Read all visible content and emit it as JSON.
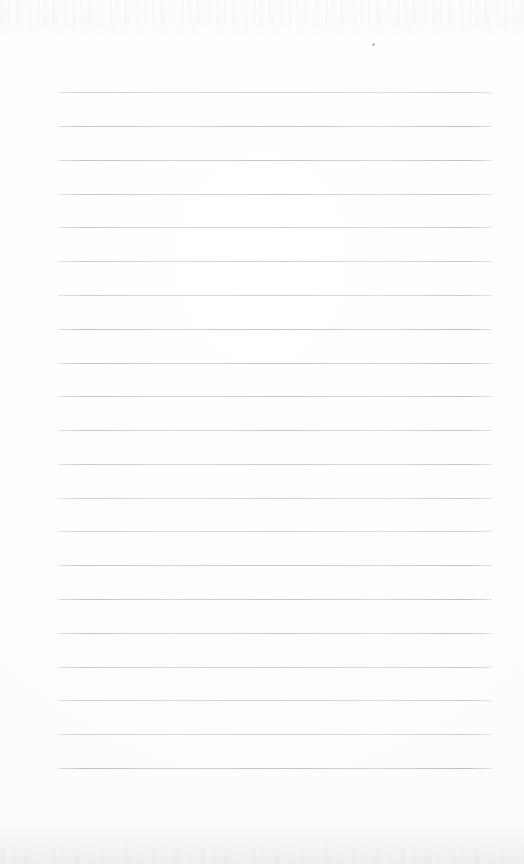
{
  "document": {
    "type": "scanned-lined-notebook-page",
    "title": "Blank Lined Notebook Page",
    "page_width": 524,
    "page_height": 864,
    "paper_color": "#fdfdfd",
    "background_color": "#ffffff",
    "has_visible_text": false,
    "written_content": "",
    "header_text": "",
    "footer_text": "",
    "page_number": ""
  },
  "ruling": {
    "line_color": "#bcbcc6",
    "line_thickness_px": 1,
    "line_count": 21,
    "line_left_px": 58,
    "line_right_px": 492,
    "line_width_px": 434,
    "line_spacing_px": 33.8,
    "first_line_y_px": 92,
    "last_line_y_px": 768,
    "line_y_positions": [
      92,
      126,
      160,
      194,
      227,
      261,
      295,
      329,
      363,
      396,
      430,
      464,
      498,
      531,
      565,
      599,
      633,
      667,
      700,
      734,
      768
    ],
    "has_vertical_margin_rule": false
  },
  "artifacts": {
    "speck": {
      "label": "dust-speck",
      "x_px": 372,
      "y_px": 43,
      "size_px": 3,
      "color": "#96969e"
    },
    "top_noise": {
      "label": "scanner-noise-top-edge",
      "y_px": 0,
      "height_px": 26,
      "color": "#e8e8ec"
    },
    "bottom_shadow": {
      "label": "scanner-shadow-bottom-edge",
      "y_px": 822,
      "height_px": 42,
      "color": "#ededf1"
    }
  }
}
